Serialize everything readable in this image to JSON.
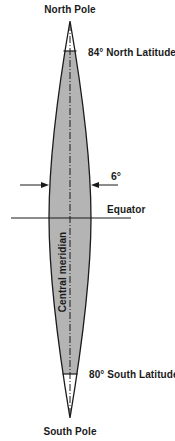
{
  "diagram": {
    "type": "transverse-mercator-zone-gore",
    "labels": {
      "north_pole": "North Pole",
      "south_pole": "South Pole",
      "north_limit": "84° North Latitude",
      "south_limit": "80° South Latitude",
      "zone_width": "6°",
      "equator": "Equator",
      "central_meridian": "Central meridian"
    },
    "zone": {
      "width_degrees": 6,
      "north_limit_latitude": 84,
      "south_limit_latitude": -80
    },
    "colors": {
      "zone_fill": "#b4b4b4",
      "outline": "#1a1a1a",
      "background": "#ffffff"
    }
  }
}
